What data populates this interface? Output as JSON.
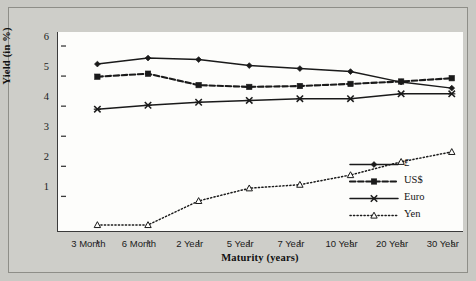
{
  "chart_data": {
    "type": "line",
    "title": "",
    "xlabel": "Maturity (years)",
    "ylabel": "Yield (in %)",
    "categories": [
      "3 Month",
      "6 Month",
      "2 Year",
      "5 Year",
      "7 Year",
      "10 Year",
      "20 Year",
      "30 Year"
    ],
    "yticks": [
      1,
      2,
      3,
      4,
      5,
      6
    ],
    "ylim": [
      -0.45,
      6.2
    ],
    "grid": false,
    "legend_position": "inside-right",
    "series": [
      {
        "name": "£",
        "marker": "filled-diamond",
        "line_style": "solid",
        "color": "#1a1a1a",
        "values": [
          5.4,
          5.6,
          5.55,
          5.35,
          5.25,
          5.15,
          4.8,
          4.6
        ]
      },
      {
        "name": "US$",
        "marker": "filled-square",
        "line_style": "dashed",
        "color": "#1a1a1a",
        "values": [
          4.98,
          5.08,
          4.7,
          4.64,
          4.67,
          4.74,
          4.82,
          4.93
        ]
      },
      {
        "name": "Euro",
        "marker": "cross-x",
        "line_style": "solid",
        "color": "#1a1a1a",
        "values": [
          3.9,
          4.03,
          4.13,
          4.19,
          4.25,
          4.25,
          4.41,
          4.41
        ]
      },
      {
        "name": "Yen",
        "marker": "open-triangle",
        "line_style": "dotted",
        "color": "#1a1a1a",
        "values": [
          0.05,
          0.05,
          0.85,
          1.27,
          1.39,
          1.71,
          2.15,
          2.48
        ]
      }
    ]
  },
  "axis": {
    "ytick_labels": [
      "6",
      "5",
      "4",
      "3",
      "2",
      "1"
    ],
    "xtick_labels": [
      "3 Month",
      "6 Month",
      "2 Year",
      "5 Year",
      "7 Year",
      "10 Year",
      "20 Year",
      "30 Year"
    ],
    "ylabel_text": "Yield (in %)",
    "xlabel_text": "Maturity (years)"
  },
  "legend": {
    "items": [
      {
        "label": "£"
      },
      {
        "label": "US$"
      },
      {
        "label": "Euro"
      },
      {
        "label": "Yen"
      }
    ]
  },
  "colors": {
    "background": "#c9c9c4",
    "panel": "#cecec9",
    "plot_background": "#fdfdfb",
    "axis": "#3b3b3b",
    "ink": "#1a1a1a"
  }
}
